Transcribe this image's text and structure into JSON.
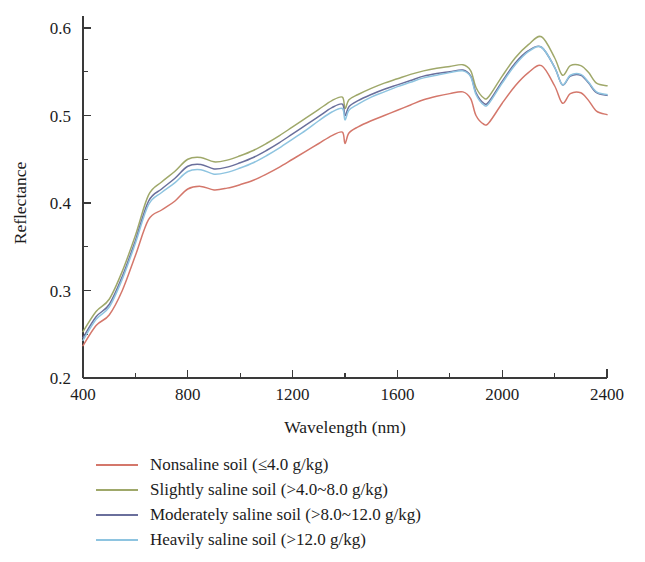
{
  "chart_data": {
    "type": "line",
    "title": "",
    "xlabel": "Wavelength (nm)",
    "ylabel": "Reflectance",
    "xlim": [
      400,
      2400
    ],
    "ylim": [
      0.2,
      0.6
    ],
    "xticks": [
      400,
      800,
      1200,
      1600,
      2000,
      2400
    ],
    "xtick_labels": [
      "400",
      "800",
      "1200",
      "1600",
      "2000",
      "2400"
    ],
    "xminor_step": 200,
    "yticks": [
      0.2,
      0.3,
      0.4,
      0.5,
      0.6
    ],
    "ytick_labels": [
      "0.2",
      "0.3",
      "0.4",
      "0.5",
      "0.6"
    ],
    "yminor_step": 0.05,
    "grid": false,
    "legend_position": "below",
    "x": [
      400,
      450,
      500,
      550,
      600,
      650,
      700,
      750,
      800,
      850,
      900,
      950,
      1000,
      1050,
      1100,
      1150,
      1200,
      1250,
      1300,
      1350,
      1390,
      1400,
      1415,
      1450,
      1500,
      1550,
      1600,
      1650,
      1700,
      1750,
      1800,
      1850,
      1880,
      1900,
      1930,
      1950,
      2000,
      2050,
      2100,
      2150,
      2200,
      2230,
      2260,
      2300,
      2330,
      2360,
      2400
    ],
    "series": [
      {
        "name": "Nonsaline soil (≤4.0 g/kg)",
        "color": "#d4776b",
        "values": [
          0.237,
          0.26,
          0.272,
          0.3,
          0.34,
          0.381,
          0.392,
          0.402,
          0.416,
          0.419,
          0.415,
          0.417,
          0.421,
          0.426,
          0.433,
          0.441,
          0.45,
          0.459,
          0.468,
          0.477,
          0.481,
          0.468,
          0.48,
          0.487,
          0.494,
          0.5,
          0.506,
          0.512,
          0.518,
          0.522,
          0.525,
          0.527,
          0.519,
          0.5,
          0.49,
          0.492,
          0.514,
          0.534,
          0.549,
          0.557,
          0.534,
          0.514,
          0.525,
          0.526,
          0.517,
          0.505,
          0.501
        ]
      },
      {
        "name": "Slightly saline soil (>4.0~8.0 g/kg)",
        "color": "#9fa86a",
        "values": [
          0.253,
          0.276,
          0.29,
          0.322,
          0.363,
          0.409,
          0.424,
          0.436,
          0.45,
          0.452,
          0.447,
          0.449,
          0.454,
          0.46,
          0.468,
          0.477,
          0.487,
          0.497,
          0.507,
          0.517,
          0.521,
          0.508,
          0.518,
          0.524,
          0.531,
          0.537,
          0.542,
          0.547,
          0.551,
          0.554,
          0.556,
          0.558,
          0.551,
          0.532,
          0.52,
          0.522,
          0.545,
          0.566,
          0.581,
          0.59,
          0.566,
          0.546,
          0.557,
          0.557,
          0.549,
          0.537,
          0.534
        ]
      },
      {
        "name": "Moderately saline soil (>8.0~12.0 g/kg)",
        "color": "#6a6f9c",
        "values": [
          0.246,
          0.27,
          0.284,
          0.316,
          0.357,
          0.402,
          0.416,
          0.428,
          0.442,
          0.444,
          0.439,
          0.441,
          0.446,
          0.452,
          0.46,
          0.469,
          0.479,
          0.489,
          0.499,
          0.509,
          0.513,
          0.5,
          0.51,
          0.517,
          0.524,
          0.53,
          0.535,
          0.54,
          0.545,
          0.548,
          0.55,
          0.552,
          0.545,
          0.526,
          0.514,
          0.516,
          0.539,
          0.56,
          0.574,
          0.578,
          0.555,
          0.535,
          0.545,
          0.546,
          0.537,
          0.526,
          0.523
        ]
      },
      {
        "name": "Heavily saline soil (>12.0 g/kg)",
        "color": "#8ec4e0",
        "values": [
          0.243,
          0.267,
          0.281,
          0.313,
          0.354,
          0.398,
          0.412,
          0.423,
          0.436,
          0.438,
          0.433,
          0.435,
          0.44,
          0.446,
          0.454,
          0.463,
          0.473,
          0.483,
          0.494,
          0.504,
          0.508,
          0.495,
          0.506,
          0.513,
          0.521,
          0.527,
          0.533,
          0.538,
          0.543,
          0.546,
          0.549,
          0.551,
          0.544,
          0.524,
          0.512,
          0.514,
          0.537,
          0.558,
          0.573,
          0.578,
          0.555,
          0.535,
          0.546,
          0.547,
          0.538,
          0.527,
          0.524
        ]
      }
    ]
  },
  "legend": {
    "items": [
      {
        "label": "Nonsaline soil (≤4.0 g/kg)",
        "color": "#d4776b"
      },
      {
        "label": "Slightly saline soil (>4.0~8.0 g/kg)",
        "color": "#9fa86a"
      },
      {
        "label": "Moderately saline soil (>8.0~12.0 g/kg)",
        "color": "#6a6f9c"
      },
      {
        "label": "Heavily saline soil (>12.0 g/kg)",
        "color": "#8ec4e0"
      }
    ]
  }
}
